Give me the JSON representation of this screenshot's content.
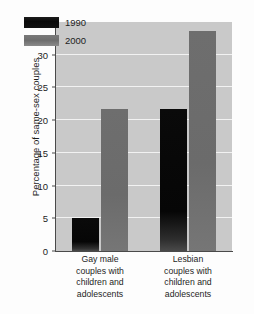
{
  "chart_data": {
    "type": "bar",
    "title": "",
    "subtitle": "",
    "xlabel": "",
    "ylabel": "Percentage of same-sex couples",
    "categories": [
      "Gay male couples with children and adolescents",
      "Lesbian couples with children and adolescents"
    ],
    "category_lines": [
      [
        "Gay male",
        "couples with",
        "children and",
        "adolescents"
      ],
      [
        "Lesbian",
        "couples with",
        "children and",
        "adolescents"
      ]
    ],
    "series": [
      {
        "name": "1990",
        "values": [
          5.0,
          21.7
        ],
        "color": "#0a0a0a"
      },
      {
        "name": "2000",
        "values": [
          21.7,
          33.6
        ],
        "color": "#6e6e6e"
      }
    ],
    "ylim": [
      0,
      35
    ],
    "yticks": [
      0,
      5,
      10,
      15,
      20,
      25,
      30,
      35
    ],
    "ytick_labels": [
      "0",
      "5",
      "10",
      "15",
      "20",
      "25",
      "30",
      "35"
    ],
    "grid": true,
    "grid_color": "#f2f2f2",
    "legend_position": "upper-left-inside",
    "plot_background": "#c9c9c9",
    "figure_background": "#fdfdfd",
    "axis_color": "#4a4a4a"
  },
  "legend": {
    "entries": [
      {
        "label": "1990"
      },
      {
        "label": "2000"
      }
    ]
  },
  "axis": {
    "y_title": "Percentage of same-sex couples",
    "y_tick_labels": [
      "0",
      "5",
      "10",
      "15",
      "20",
      "25",
      "30",
      "35"
    ]
  }
}
